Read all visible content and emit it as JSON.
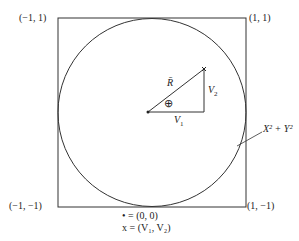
{
  "corners": {
    "top_left": "(−1, 1)",
    "top_right": "(1, 1)",
    "bottom_left": "(−1, −1)",
    "bottom_right": "(1, −1)"
  },
  "vector_label": "R̄",
  "leg_horizontal": "V",
  "leg_horizontal_sub": "1",
  "leg_vertical": "V",
  "leg_vertical_sub": "2",
  "angle_symbol": "⊕",
  "circle_label": "X² + Y²",
  "legend": {
    "dot_line": "• = (0, 0)",
    "x_line": "x = (V₁, V₂)"
  },
  "colors": {
    "stroke": "#333333",
    "background": "#ffffff"
  }
}
